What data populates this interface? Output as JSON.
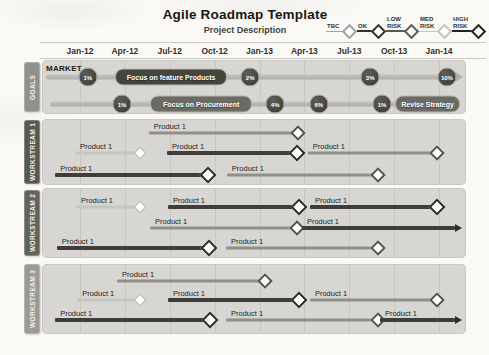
{
  "header": {
    "title": "Agile Roadmap Template",
    "subtitle": "Project Description"
  },
  "legend": [
    {
      "label": "TBC",
      "color": "#a3a29d",
      "thick": false,
      "width": 29
    },
    {
      "label": "OK",
      "color": "#33322e",
      "thick": true,
      "width": 27
    },
    {
      "label": "LOW\nRISK",
      "color": "#5a5953",
      "thick": true,
      "width": 31
    },
    {
      "label": "MED\nRISK",
      "color": "#c5c4bf",
      "thick": false,
      "width": 31
    },
    {
      "label": "HIGH\nRISK",
      "color": "#232220",
      "thick": true,
      "width": 32
    }
  ],
  "timeline": [
    "Jan-12",
    "Apr-12",
    "Jul-12",
    "Oct-12",
    "Jan-13",
    "Apr-13",
    "Jul-13",
    "Oct-13",
    "Jan-14"
  ],
  "palette": {
    "panel": "#d7d6d2",
    "bar_light": "#c6c5c0",
    "bar_medium": "#908f88",
    "bar_dark": "#3e3d39",
    "goal_line": "#b2b1ac",
    "badge_fill": "#45443f",
    "pill_dark": "#45443f",
    "pill_medium": "#6b6a63"
  },
  "sections": [
    {
      "label": "GOALS",
      "kind": "goals",
      "tab_color": "#91908b",
      "rows": [
        {
          "caption": "MARKET",
          "line": {
            "start": 0.9,
            "end": 97.5,
            "arrow": true
          },
          "milestones": [
            {
              "label": "1%",
              "pos": 10.8
            },
            {
              "label": "2%",
              "pos": 49.1
            },
            {
              "label": "3%",
              "pos": 77.4
            },
            {
              "label": "10%",
              "pos": 95.5
            }
          ],
          "pills": [
            {
              "label": "Focus on feature Products",
              "start": 17.2,
              "end": 43.2,
              "color": "#45443f"
            }
          ]
        },
        {
          "caption": "",
          "line": {
            "start": 1.9,
            "end": 98.6,
            "arrow": false
          },
          "milestones": [
            {
              "label": "1%",
              "pos": 18.9
            },
            {
              "label": "4%",
              "pos": 55.0
            },
            {
              "label": "6%",
              "pos": 65.3
            },
            {
              "label": "1%",
              "pos": 80.2
            }
          ],
          "pills": [
            {
              "label": "Focus on Procurement",
              "start": 25.5,
              "end": 49.1,
              "color": "#6b6a63"
            },
            {
              "label": "Revise Strategy",
              "start": 83.3,
              "end": 98.1,
              "color": "#6b6a63"
            }
          ]
        }
      ]
    },
    {
      "label": "WORKSTREAM 1",
      "kind": "stream",
      "tab_color": "#585751",
      "rows": [
        {
          "segments": [
            {
              "label": "Product 1",
              "start": 25.2,
              "end": 60.4,
              "shade": "medium",
              "marker": "mid"
            }
          ]
        },
        {
          "segments": [
            {
              "label": "Product 1",
              "start": 7.8,
              "end": 23.1,
              "shade": "light",
              "marker": "light"
            },
            {
              "label": "Product 1",
              "start": 29.5,
              "end": 60.1,
              "shade": "dark",
              "marker": "dark"
            },
            {
              "label": "Product 1",
              "start": 62.7,
              "end": 93.2,
              "shade": "medium",
              "marker": "mid"
            }
          ]
        },
        {
          "segments": [
            {
              "label": "Product 1",
              "start": 3.1,
              "end": 39.2,
              "shade": "dark",
              "marker": "dark"
            },
            {
              "label": "Product 1",
              "start": 43.6,
              "end": 79.2,
              "shade": "medium",
              "marker": "mid"
            }
          ]
        }
      ]
    },
    {
      "label": "WORKSTREAM 2",
      "kind": "stream",
      "tab_color": "#63625c",
      "rows": [
        {
          "segments": [
            {
              "label": "Product 1",
              "start": 8.0,
              "end": 23.1,
              "shade": "light",
              "marker": "light"
            },
            {
              "label": "Product 1",
              "start": 29.7,
              "end": 60.6,
              "shade": "dark",
              "marker": "dark"
            },
            {
              "label": "Product 1",
              "start": 63.2,
              "end": 93.2,
              "shade": "dark",
              "marker": "dark"
            }
          ]
        },
        {
          "segments": [
            {
              "label": "Product 1",
              "start": 25.5,
              "end": 60.1,
              "shade": "medium",
              "marker": "mid"
            },
            {
              "label": "Product 1",
              "start": 61.3,
              "end": 98.8,
              "shade": "dark",
              "marker": "arrow"
            }
          ]
        },
        {
          "segments": [
            {
              "label": "Product 1",
              "start": 3.5,
              "end": 39.4,
              "shade": "dark",
              "marker": "dark"
            },
            {
              "label": "Product 1",
              "start": 43.4,
              "end": 79.2,
              "shade": "medium",
              "marker": "mid"
            }
          ]
        }
      ]
    },
    {
      "label": "WORKSTREAM 3",
      "kind": "stream",
      "tab_color": "#9b9a94",
      "rows": [
        {
          "segments": [
            {
              "label": "Product 1",
              "start": 17.7,
              "end": 52.6,
              "shade": "medium",
              "marker": "mid"
            }
          ]
        },
        {
          "segments": [
            {
              "label": "Product 1",
              "start": 8.3,
              "end": 23.1,
              "shade": "light",
              "marker": "light"
            },
            {
              "label": "Product 1",
              "start": 29.7,
              "end": 60.6,
              "shade": "dark",
              "marker": "dark"
            },
            {
              "label": "Product 1",
              "start": 63.2,
              "end": 93.2,
              "shade": "medium",
              "marker": "mid"
            }
          ]
        },
        {
          "segments": [
            {
              "label": "Product 1",
              "start": 3.1,
              "end": 39.6,
              "shade": "dark",
              "marker": "dark"
            },
            {
              "label": "Product 1",
              "start": 43.4,
              "end": 79.2,
              "shade": "medium",
              "marker": "mid"
            },
            {
              "label": "Product 1",
              "start": 79.7,
              "end": 98.8,
              "shade": "dark",
              "marker": "arrow"
            }
          ]
        }
      ]
    }
  ]
}
